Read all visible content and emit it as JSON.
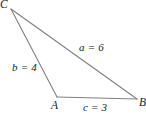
{
  "figure": {
    "type": "triangle-diagram",
    "background_color": "#ffffff",
    "line_color": "#808080",
    "text_color": "#1a1a1a"
  },
  "vertices": {
    "C": {
      "label": "C",
      "x": 11,
      "y": 9
    },
    "A": {
      "label": "A",
      "x": 57,
      "y": 97
    },
    "B": {
      "label": "B",
      "x": 137,
      "y": 99
    }
  },
  "sides": {
    "a": {
      "label": "a = 6",
      "value": 6,
      "from": "C",
      "to": "B"
    },
    "b": {
      "label": "b = 4",
      "value": 4,
      "from": "C",
      "to": "A"
    },
    "c": {
      "label": "c = 3",
      "value": 3,
      "from": "A",
      "to": "B"
    }
  }
}
